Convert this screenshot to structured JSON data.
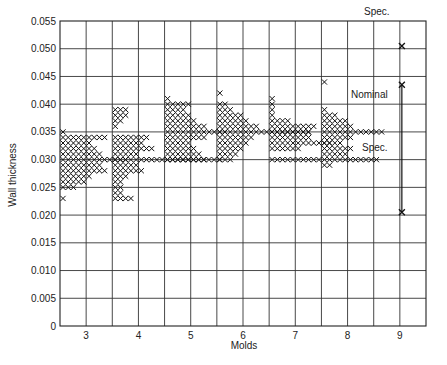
{
  "chart_data": {
    "type": "scatter",
    "subtype": "tally-histogram",
    "title": "",
    "xlabel": "Molds",
    "ylabel": "Wall thickness",
    "ylim": [
      0,
      0.055
    ],
    "yticks": [
      "0",
      "0.005",
      "0.010",
      "0.015",
      "0.020",
      "0.025",
      "0.030",
      "0.035",
      "0.040",
      "0.045",
      "0.050",
      "0.055"
    ],
    "categories": [
      "3",
      "4",
      "5",
      "6",
      "7",
      "8",
      "9"
    ],
    "grid": true,
    "series": [
      {
        "name": "Mold 3",
        "levels": [
          0.023,
          0.025,
          0.026,
          0.027,
          0.028,
          0.029,
          0.03,
          0.031,
          0.032,
          0.033,
          0.034,
          0.035
        ],
        "counts": [
          1,
          3,
          5,
          6,
          9,
          8,
          13,
          8,
          7,
          6,
          9,
          1
        ]
      },
      {
        "name": "Mold 4",
        "levels": [
          0.023,
          0.024,
          0.025,
          0.026,
          0.027,
          0.028,
          0.029,
          0.03,
          0.031,
          0.032,
          0.033,
          0.034,
          0.036,
          0.037,
          0.038,
          0.039
        ],
        "counts": [
          4,
          2,
          2,
          2,
          3,
          6,
          5,
          21,
          5,
          8,
          6,
          7,
          1,
          2,
          3,
          3
        ]
      },
      {
        "name": "Mold 5",
        "levels": [
          0.03,
          0.031,
          0.032,
          0.033,
          0.034,
          0.035,
          0.036,
          0.037,
          0.038,
          0.039,
          0.04,
          0.041
        ],
        "counts": [
          8,
          7,
          6,
          5,
          8,
          12,
          8,
          6,
          5,
          4,
          5,
          1
        ]
      },
      {
        "name": "Mold 6",
        "levels": [
          0.03,
          0.031,
          0.032,
          0.033,
          0.034,
          0.035,
          0.036,
          0.037,
          0.038,
          0.039,
          0.04,
          0.042
        ],
        "counts": [
          3,
          4,
          5,
          6,
          7,
          18,
          8,
          6,
          5,
          3,
          2,
          1
        ]
      },
      {
        "name": "Mold 7",
        "levels": [
          0.03,
          0.032,
          0.033,
          0.034,
          0.035,
          0.036,
          0.037,
          0.038,
          0.039,
          0.04,
          0.041
        ],
        "counts": [
          10,
          6,
          12,
          8,
          8,
          9,
          4,
          1,
          1,
          1,
          1
        ]
      },
      {
        "name": "Mold 8",
        "levels": [
          0.029,
          0.03,
          0.031,
          0.032,
          0.033,
          0.034,
          0.035,
          0.036,
          0.037,
          0.038,
          0.039,
          0.044
        ],
        "counts": [
          2,
          11,
          5,
          6,
          4,
          6,
          12,
          6,
          5,
          3,
          1,
          1
        ]
      }
    ],
    "mold9_specs": {
      "upper_spec": 0.0505,
      "nominal": 0.0435,
      "lower_spec": 0.0205
    },
    "annotations": [
      "Spec.",
      "Nominal",
      "Spec."
    ]
  },
  "labels": {
    "upper_spec": "Spec.",
    "nominal": "Nominal",
    "lower_spec": "Spec."
  }
}
